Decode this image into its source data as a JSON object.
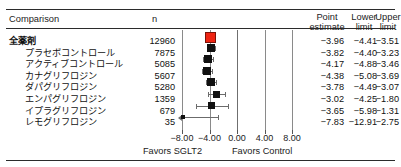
{
  "figure": {
    "type": "forest-plot",
    "header": {
      "comparison": "Comparison",
      "n": "n",
      "point_estimate_l1": "Point",
      "point_estimate_l2": "estimate",
      "lower_l1": "Lower",
      "lower_l2": "limit",
      "upper_l1": "Upper",
      "upper_l2": "limit"
    },
    "axis": {
      "ticks": [
        "−8.00",
        "−4.00",
        "0.00",
        "4.00",
        "8.00"
      ],
      "tick_values": [
        -8,
        -4,
        0,
        4,
        8
      ],
      "min": -8,
      "max": 8,
      "favors_left": "Favors SGLT2",
      "favors_right": "Favors Control"
    },
    "colors": {
      "summary_marker": "#ee2412",
      "study_marker": "#111111",
      "rule": "#2b2b2b",
      "gridline": "#8a8a8a"
    }
  },
  "chart_data": {
    "type": "forest",
    "title": "",
    "xlabel": "",
    "ylabel": "",
    "xlim": [
      -8,
      8
    ],
    "xticks": [
      -8,
      -4,
      0,
      4,
      8
    ],
    "xticklabels": [
      "−8.00",
      "−4.00",
      "0.00",
      "4.00",
      "8.00"
    ],
    "grid": true,
    "legend": "none",
    "columns": [
      "Comparison",
      "n",
      "Point estimate",
      "Lower limit",
      "Upper limit"
    ],
    "rows": [
      {
        "label": "全薬剤",
        "indent": false,
        "bold": true,
        "n": "12960",
        "n_value": 12960,
        "point_estimate": "−3.96",
        "lower_limit": "−4.41",
        "upper_limit": "−3.51",
        "pe": -3.96,
        "ll": -4.41,
        "ul": -3.51,
        "is_summary": true,
        "marker_size": 9
      },
      {
        "label": "プラセボコントロール",
        "indent": true,
        "bold": false,
        "n": "7875",
        "n_value": 7875,
        "point_estimate": "−3.82",
        "lower_limit": "−4.40",
        "upper_limit": "−3.23",
        "pe": -3.82,
        "ll": -4.4,
        "ul": -3.23,
        "is_summary": false,
        "marker_size": 8
      },
      {
        "label": "アクティブコントロール",
        "indent": true,
        "bold": false,
        "n": "5085",
        "n_value": 5085,
        "point_estimate": "−4.17",
        "lower_limit": "−4.88",
        "upper_limit": "−3.46",
        "pe": -4.17,
        "ll": -4.88,
        "ul": -3.46,
        "is_summary": false,
        "marker_size": 8
      },
      {
        "label": "カナグリフロジン",
        "indent": true,
        "bold": false,
        "n": "5607",
        "n_value": 5607,
        "point_estimate": "−4.38",
        "lower_limit": "−5.08",
        "upper_limit": "−3.69",
        "pe": -4.38,
        "ll": -5.08,
        "ul": -3.69,
        "is_summary": false,
        "marker_size": 8
      },
      {
        "label": "ダパグリフロジン",
        "indent": true,
        "bold": false,
        "n": "5280",
        "n_value": 5280,
        "point_estimate": "−3.78",
        "lower_limit": "−4.49",
        "upper_limit": "−3.07",
        "pe": -3.78,
        "ll": -4.49,
        "ul": -3.07,
        "is_summary": false,
        "marker_size": 8
      },
      {
        "label": "エンパグリフロジン",
        "indent": true,
        "bold": false,
        "n": "1359",
        "n_value": 1359,
        "point_estimate": "−3.02",
        "lower_limit": "−4.25",
        "upper_limit": "−1.80",
        "pe": -3.02,
        "ll": -4.25,
        "ul": -1.8,
        "is_summary": false,
        "marker_size": 7
      },
      {
        "label": "イプラグリフロジン",
        "indent": true,
        "bold": false,
        "n": "679",
        "n_value": 679,
        "point_estimate": "−3.65",
        "lower_limit": "−5.98",
        "upper_limit": "−1.31",
        "pe": -3.65,
        "ll": -5.98,
        "ul": -1.31,
        "is_summary": false,
        "marker_size": 7
      },
      {
        "label": "レモグリフロジン",
        "indent": true,
        "bold": false,
        "n": "35",
        "n_value": 35,
        "point_estimate": "−7.83",
        "lower_limit": "−12.91",
        "upper_limit": "−2.75",
        "pe": -7.83,
        "ll": -12.91,
        "ul": -2.75,
        "is_summary": false,
        "marker_size": 4,
        "clipped_left": true
      }
    ]
  }
}
